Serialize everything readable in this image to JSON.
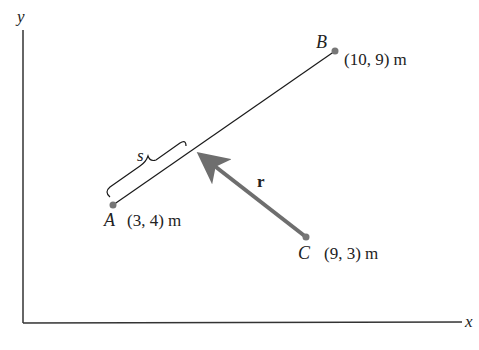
{
  "diagram": {
    "axes": {
      "x_label": "x",
      "y_label": "y"
    },
    "points": [
      {
        "name": "A",
        "coords": "(3, 4) m"
      },
      {
        "name": "B",
        "coords": "(10, 9) m"
      },
      {
        "name": "C",
        "coords": "(9, 3) m"
      }
    ],
    "segment_label": "s",
    "vector_label": "r",
    "colors": {
      "line": "#1a1a1a",
      "vector": "#6e6e6e",
      "point": "#777777"
    }
  }
}
